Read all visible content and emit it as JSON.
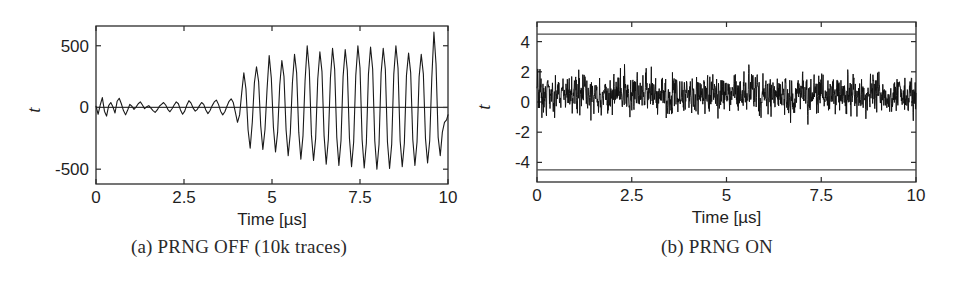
{
  "figure": {
    "panels": [
      {
        "id": "a",
        "caption": "(a) PRNG OFF (10k traces)",
        "xlabel": "Time [µs]",
        "ylabel": "t"
      },
      {
        "id": "b",
        "caption": "(b) PRNG ON",
        "xlabel": "Time [µs]",
        "ylabel": "t"
      }
    ]
  },
  "chart_data": [
    {
      "type": "line",
      "panel": "a",
      "title": "(a) PRNG OFF (10k traces)",
      "xlabel": "Time [µs]",
      "ylabel": "t",
      "xlim": [
        0,
        10
      ],
      "ylim": [
        -620,
        660
      ],
      "xticks": [
        0,
        2.5,
        5,
        7.5,
        10
      ],
      "xticklabels": [
        "0",
        "2.5",
        "5",
        "7.5",
        "10"
      ],
      "yticks": [
        -500,
        0,
        500
      ],
      "yticklabels": [
        "-500",
        "0",
        "500"
      ],
      "grid": false,
      "legend": null,
      "zero_line": 0,
      "description": "Welch t-statistic trace with PRNG disabled; near-zero noise before ~4.3 us then large growing sinusoidal leakage reaching +-500 and a peak near 610 at about 9.3 us.",
      "series": [
        {
          "name": "t-statistic",
          "color": "#1a1a1a",
          "x": [
            0.0,
            0.06,
            0.12,
            0.18,
            0.24,
            0.3,
            0.36,
            0.42,
            0.48,
            0.54,
            0.6,
            0.66,
            0.72,
            0.78,
            0.84,
            0.9,
            0.96,
            1.02,
            1.08,
            1.14,
            1.2,
            1.26,
            1.32,
            1.38,
            1.44,
            1.5,
            1.56,
            1.62,
            1.68,
            1.74,
            1.8,
            1.86,
            1.92,
            1.98,
            2.04,
            2.1,
            2.16,
            2.22,
            2.28,
            2.34,
            2.4,
            2.46,
            2.52,
            2.58,
            2.64,
            2.7,
            2.76,
            2.82,
            2.88,
            2.94,
            3.0,
            3.06,
            3.12,
            3.18,
            3.24,
            3.3,
            3.36,
            3.42,
            3.48,
            3.54,
            3.6,
            3.66,
            3.72,
            3.78,
            3.84,
            3.9,
            3.96,
            4.02,
            4.08,
            4.14,
            4.2,
            4.26,
            4.32,
            4.38,
            4.44,
            4.5,
            4.56,
            4.62,
            4.68,
            4.74,
            4.8,
            4.86,
            4.92,
            4.98,
            5.04,
            5.1,
            5.16,
            5.22,
            5.28,
            5.34,
            5.4,
            5.46,
            5.52,
            5.58,
            5.64,
            5.7,
            5.76,
            5.82,
            5.88,
            5.94,
            6.0,
            6.06,
            6.12,
            6.18,
            6.24,
            6.3,
            6.36,
            6.42,
            6.48,
            6.54,
            6.6,
            6.66,
            6.72,
            6.78,
            6.84,
            6.9,
            6.96,
            7.02,
            7.08,
            7.14,
            7.2,
            7.26,
            7.32,
            7.38,
            7.44,
            7.5,
            7.56,
            7.62,
            7.68,
            7.74,
            7.8,
            7.86,
            7.92,
            7.98,
            8.04,
            8.1,
            8.16,
            8.22,
            8.28,
            8.34,
            8.4,
            8.46,
            8.52,
            8.58,
            8.64,
            8.7,
            8.76,
            8.82,
            8.88,
            8.94,
            9.0,
            9.06,
            9.12,
            9.18,
            9.24,
            9.3,
            9.36,
            9.42,
            9.48,
            9.54,
            9.6,
            9.66,
            9.72,
            9.78,
            9.84,
            9.9,
            9.96,
            10.0
          ],
          "y": [
            10,
            -55,
            20,
            80,
            -30,
            -70,
            15,
            40,
            5,
            -45,
            50,
            75,
            30,
            -25,
            -60,
            -20,
            25,
            10,
            -15,
            5,
            30,
            45,
            20,
            -10,
            5,
            15,
            -5,
            -25,
            -40,
            -20,
            10,
            25,
            40,
            20,
            -15,
            -35,
            -10,
            20,
            45,
            30,
            -20,
            -55,
            -30,
            20,
            55,
            35,
            -5,
            -30,
            -15,
            15,
            40,
            25,
            -20,
            -50,
            -25,
            15,
            45,
            60,
            25,
            -30,
            -60,
            -35,
            10,
            50,
            70,
            40,
            -40,
            -120,
            -60,
            120,
            280,
            150,
            -180,
            -330,
            -120,
            200,
            330,
            210,
            -150,
            -340,
            -180,
            150,
            420,
            240,
            -160,
            -360,
            -200,
            180,
            380,
            250,
            -180,
            -390,
            -210,
            200,
            430,
            280,
            -200,
            -420,
            -230,
            220,
            500,
            300,
            -220,
            -430,
            -250,
            230,
            450,
            290,
            -230,
            -460,
            -260,
            240,
            480,
            310,
            -240,
            -470,
            -270,
            250,
            470,
            300,
            -250,
            -480,
            -280,
            260,
            500,
            320,
            -260,
            -490,
            -290,
            270,
            490,
            310,
            -270,
            -500,
            -300,
            280,
            480,
            310,
            -280,
            -495,
            -300,
            270,
            500,
            320,
            -270,
            -480,
            -290,
            260,
            440,
            280,
            -260,
            -470,
            -280,
            250,
            430,
            270,
            -250,
            -450,
            -270,
            240,
            610,
            350,
            -240,
            -390,
            -200,
            -120,
            -100,
            -60,
            90,
            280,
            120,
            -60,
            -120,
            -80,
            20,
            60,
            30
          ]
        }
      ]
    },
    {
      "type": "line",
      "panel": "b",
      "title": "(b) PRNG ON",
      "xlabel": "Time [µs]",
      "ylabel": "t",
      "xlim": [
        0,
        10
      ],
      "ylim": [
        -5.3,
        5.3
      ],
      "xticks": [
        0,
        2.5,
        5,
        7.5,
        10
      ],
      "xticklabels": [
        "0",
        "2.5",
        "5",
        "7.5",
        "10"
      ],
      "yticks": [
        -4,
        -2,
        0,
        2,
        4
      ],
      "yticklabels": [
        "-4",
        "-2",
        "0",
        "2",
        "4"
      ],
      "grid": false,
      "legend": null,
      "threshold_lines": [
        4.5,
        -4.5
      ],
      "description": "Welch t-statistic trace with PRNG enabled; dense high-frequency noise bounded roughly within -3 to +4, never crossing the +-4.5 significance thresholds drawn as horizontal lines near the top and bottom of the axes.",
      "series": [
        {
          "name": "t-statistic",
          "color": "#101010",
          "noise_band": [
            -3.0,
            4.0
          ],
          "mean": 0.5,
          "std": 1.15,
          "samples": 1400
        }
      ]
    }
  ]
}
